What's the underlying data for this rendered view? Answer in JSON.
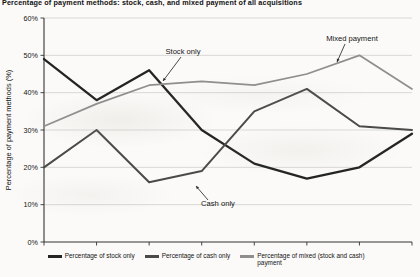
{
  "figure": {
    "title": "Percentage of payment methods: stock, cash, and mixed payment of all acquisitions"
  },
  "colors": {
    "stock": "#242424",
    "cash": "#4a4a4a",
    "mixed": "#8e8e8e",
    "gridline": "#c9c9c9",
    "axis": "#333333",
    "text": "#141414"
  },
  "annotations": [
    {
      "id": "stock-only",
      "label": "Stock only"
    },
    {
      "id": "cash-only",
      "label": "Cash only"
    },
    {
      "id": "mixed-payment",
      "label": "Mixed payment"
    }
  ],
  "legend": {
    "items": [
      {
        "id": "stock",
        "label": "Percentage of stock only",
        "color": "#242424"
      },
      {
        "id": "cash",
        "label": "Percentage of cash only",
        "color": "#4a4a4a"
      },
      {
        "id": "mixed",
        "label": "Percentage of mixed (stock and cash) payment",
        "color": "#8e8e8e"
      }
    ]
  },
  "chart_data": {
    "type": "line",
    "title": "Percentage of payment methods: stock, cash, and mixed payment of all acquisitions",
    "xlabel": "",
    "ylabel": "Percentage of payment methods (%)",
    "categories": [
      "1985–89",
      "1990–94",
      "1995–99",
      "2000–04",
      "2005–09",
      "2010–14",
      "2015–19",
      "2020–22"
    ],
    "ylim": [
      0,
      60
    ],
    "yticks": [
      0,
      10,
      20,
      30,
      40,
      50,
      60
    ],
    "ytick_labels": [
      "0%",
      "10%",
      "20%",
      "30%",
      "40%",
      "50%",
      "60%"
    ],
    "grid": true,
    "legend_position": "bottom",
    "series": [
      {
        "name": "Percentage of stock only",
        "color": "#242424",
        "values": [
          49,
          38,
          46,
          30,
          21,
          17,
          20,
          29
        ]
      },
      {
        "name": "Percentage of cash only",
        "color": "#4a4a4a",
        "values": [
          20,
          30,
          16,
          19,
          35,
          41,
          31,
          30
        ]
      },
      {
        "name": "Percentage of mixed (stock and cash) payment",
        "color": "#8e8e8e",
        "values": [
          31,
          37,
          42,
          43,
          42,
          45,
          50,
          41
        ]
      }
    ]
  }
}
